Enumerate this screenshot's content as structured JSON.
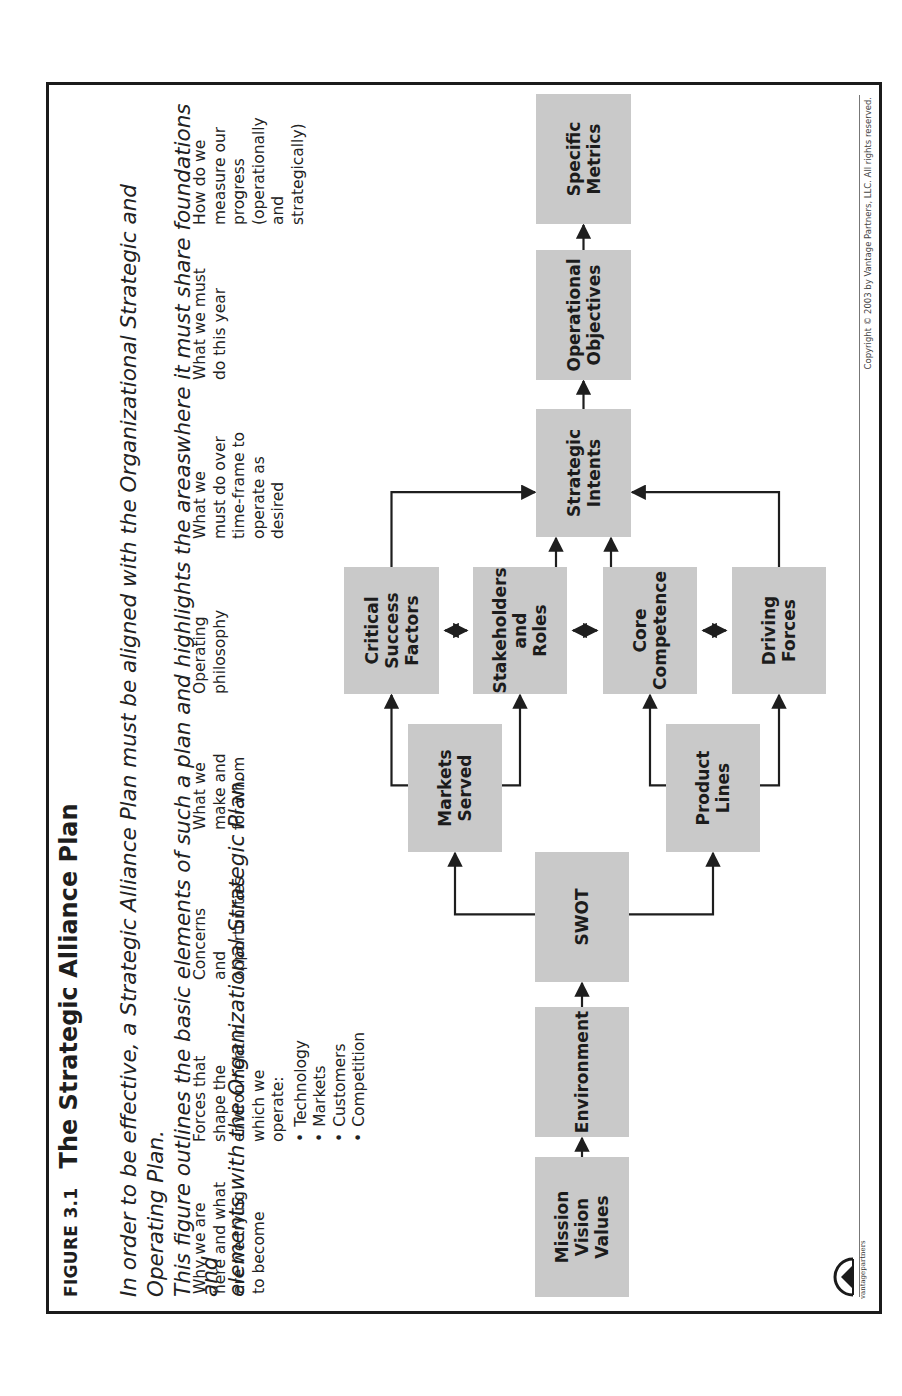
{
  "figure": {
    "label": "FIGURE 3.1",
    "title": "The Strategic Alliance Plan",
    "subtitle_lines": [
      "In order to be effective, a Strategic Alliance Plan must be aligned with the Organizational Strategic and Operating Plan.",
      "This figure outlines the basic elements of such a plan and highlights the areaswhere it must share foundations and",
      "elements with the Organizational Strategic Plan."
    ]
  },
  "descriptions": [
    {
      "lines": [
        "Why we are",
        "here and what",
        "are we trying",
        "to become"
      ]
    },
    {
      "lines": [
        "Forces that",
        "shape the",
        "environment in",
        "which we",
        "operate:"
      ],
      "bullets": [
        "Technology",
        "Markets",
        "Customers",
        "Competition"
      ]
    },
    {
      "lines": [
        "Concerns",
        "and",
        "opportunities"
      ]
    },
    {
      "lines": [
        "What we",
        "make and",
        "for whom"
      ]
    },
    {
      "lines": [
        "Operating",
        "philosophy"
      ]
    },
    {
      "lines": [
        "What we",
        "must do over",
        "time-frame to",
        "operate as",
        "desired"
      ]
    },
    {
      "lines": [
        "What we must",
        "do this year"
      ]
    },
    {
      "lines": [
        "How do we",
        "measure our",
        "progress",
        "(operationally",
        "and",
        "strategically)"
      ]
    }
  ],
  "nodes": {
    "mission": "Mission Vision Values",
    "environment": "Environment",
    "swot": "SWOT",
    "markets": "Markets Served",
    "products": "Product Lines",
    "csf": "Critical Success Factors",
    "stakeholders": "Stakeholders and Roles",
    "core": "Core Competence",
    "driving": "Driving Forces",
    "intents": "Strategic Intents",
    "objectives": "Operational Objectives",
    "metrics": "Specific Metrics"
  },
  "node_lines": {
    "mission": [
      "Mission",
      "Vision",
      "Values"
    ],
    "environment": [
      "Environment"
    ],
    "swot": [
      "SWOT"
    ],
    "markets": [
      "Markets",
      "Served"
    ],
    "products": [
      "Product",
      "Lines"
    ],
    "csf": [
      "Critical",
      "Success",
      "Factors"
    ],
    "stakeholders": [
      "Stakeholders",
      "and",
      "Roles"
    ],
    "core": [
      "Core",
      "Competence"
    ],
    "driving": [
      "Driving",
      "Forces"
    ],
    "intents": [
      "Strategic",
      "Intents"
    ],
    "objectives": [
      "Operational",
      "Objectives"
    ],
    "metrics": [
      "Specific",
      "Metrics"
    ]
  },
  "edges": [
    {
      "from": "mission",
      "to": "environment",
      "type": "arrow"
    },
    {
      "from": "environment",
      "to": "swot",
      "type": "arrow"
    },
    {
      "from": "swot",
      "to": "markets",
      "type": "arrow"
    },
    {
      "from": "swot",
      "to": "products",
      "type": "arrow"
    },
    {
      "from": "markets",
      "to": "csf",
      "type": "arrow"
    },
    {
      "from": "markets",
      "to": "stakeholders",
      "type": "arrow"
    },
    {
      "from": "products",
      "to": "core",
      "type": "arrow"
    },
    {
      "from": "products",
      "to": "driving",
      "type": "arrow"
    },
    {
      "from": "csf",
      "to": "stakeholders",
      "type": "bidirectional"
    },
    {
      "from": "stakeholders",
      "to": "core",
      "type": "bidirectional"
    },
    {
      "from": "core",
      "to": "driving",
      "type": "bidirectional"
    },
    {
      "from": "csf",
      "to": "intents",
      "type": "arrow"
    },
    {
      "from": "stakeholders",
      "to": "intents",
      "type": "arrow"
    },
    {
      "from": "core",
      "to": "intents",
      "type": "arrow"
    },
    {
      "from": "driving",
      "to": "intents",
      "type": "arrow"
    },
    {
      "from": "intents",
      "to": "objectives",
      "type": "arrow"
    },
    {
      "from": "objectives",
      "to": "metrics",
      "type": "arrow"
    }
  ],
  "footer": {
    "copyright": "Copyright © 2003 by Vantage Partners, LLC. All rights reserved.",
    "logo_text": "vantagepartners"
  },
  "colors": {
    "box_fill": "#c9c9c9",
    "line": "#1e1e1e"
  }
}
